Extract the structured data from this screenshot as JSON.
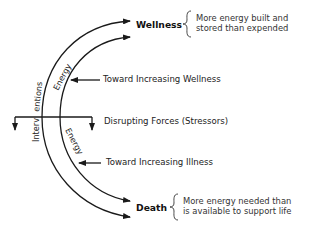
{
  "diagram": {
    "type": "wellness-illness continuum",
    "endpoints": {
      "top": {
        "label": "Wellness",
        "description_line1": "More energy built and",
        "description_line2": "stored than expended"
      },
      "bottom": {
        "label": "Death",
        "description_line1": "More energy needed than",
        "description_line2": "is available to support life"
      }
    },
    "arrows": {
      "toward_wellness": "Toward Increasing Wellness",
      "disrupting_forces": "Disrupting Forces (Stressors)",
      "toward_illness": "Toward Increasing Illness"
    },
    "arc_labels": {
      "outer": "Interventions",
      "inner_top": "Energy",
      "inner_bottom": "Energy"
    },
    "colors": {
      "line": "#1a1a1a",
      "text": "#222222",
      "background": "#ffffff"
    }
  }
}
